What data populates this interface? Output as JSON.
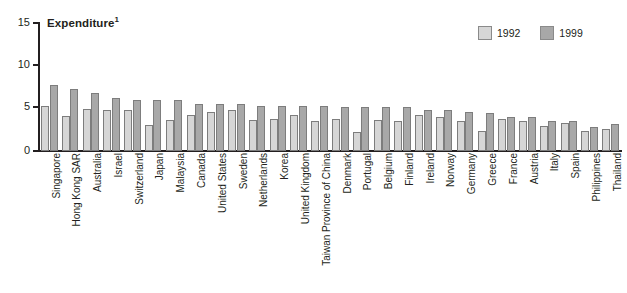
{
  "chart_data": {
    "type": "bar",
    "title": "Expenditure",
    "title_superscript": "1",
    "xlabel": "",
    "ylabel": "",
    "ylim": [
      0,
      15
    ],
    "yticks": [
      0,
      5,
      10,
      15
    ],
    "ytick_labels": [
      "0",
      "5",
      "10",
      "15"
    ],
    "grid": false,
    "legend_position": "top-right",
    "categories": [
      "Singapore",
      "Hong Kong SAR",
      "Australia",
      "Israel",
      "Switzerland",
      "Japan",
      "Malaysia",
      "Canada",
      "United States",
      "Sweden",
      "Netherlands",
      "Korea",
      "United Kingdom",
      "Taiwan Province of China",
      "Denmark",
      "Portugal",
      "Belgium",
      "Finland",
      "Ireland",
      "Norway",
      "Germany",
      "Greece",
      "France",
      "Austria",
      "Italy",
      "Spain",
      "Philippines",
      "Thailand"
    ],
    "series": [
      {
        "name": "1992",
        "color": "#d6d6d6",
        "values": [
          5.2,
          4.0,
          4.8,
          4.7,
          4.7,
          3.0,
          3.6,
          4.1,
          4.5,
          4.7,
          3.6,
          3.7,
          4.1,
          3.4,
          3.7,
          2.2,
          3.6,
          3.5,
          4.1,
          3.9,
          3.5,
          2.3,
          3.7,
          3.4,
          2.9,
          3.2,
          2.3,
          2.5
        ]
      },
      {
        "name": "1999",
        "color": "#a8a8a8",
        "values": [
          7.7,
          7.2,
          6.7,
          6.1,
          5.9,
          5.9,
          5.9,
          5.4,
          5.4,
          5.4,
          5.2,
          5.2,
          5.2,
          5.2,
          5.1,
          5.1,
          5.1,
          5.1,
          4.7,
          4.7,
          4.5,
          4.4,
          3.9,
          3.9,
          3.5,
          3.5,
          2.8,
          3.1
        ]
      }
    ]
  },
  "legend": {
    "items": [
      {
        "label": "1992",
        "color": "#d6d6d6"
      },
      {
        "label": "1999",
        "color": "#a8a8a8"
      }
    ]
  }
}
